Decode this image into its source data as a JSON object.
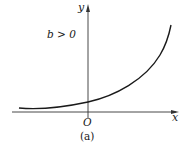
{
  "figure": {
    "caption": "(a)",
    "condition_label": "b > 0",
    "axes": {
      "x_label": "x",
      "y_label": "y",
      "origin_label": "O"
    },
    "curve": {
      "description": "exponential growth curve y = a·e^(bx) with b > 0",
      "color": "#1a1a1a"
    },
    "axis_color": "#333333"
  }
}
